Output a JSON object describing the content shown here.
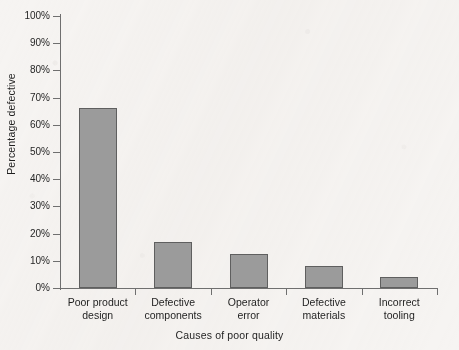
{
  "chart_data": {
    "type": "bar",
    "title": "",
    "xlabel": "Causes of poor quality",
    "ylabel": "Percentage defective",
    "categories": [
      "Poor product design",
      "Defective components",
      "Operator error",
      "Defective materials",
      "Incorrect tooling"
    ],
    "category_lines": [
      [
        "Poor product",
        "design"
      ],
      [
        "Defective",
        "components"
      ],
      [
        "Operator",
        "error"
      ],
      [
        "Defective",
        "materials"
      ],
      [
        "Incorrect",
        "tooling"
      ]
    ],
    "values": [
      66,
      17,
      12.5,
      8,
      4
    ],
    "ylim": [
      0,
      100
    ],
    "ytick_values": [
      0,
      10,
      20,
      30,
      40,
      50,
      60,
      70,
      80,
      90,
      100
    ],
    "ytick_labels": [
      "0%",
      "10%",
      "20%",
      "30%",
      "40%",
      "50%",
      "60%",
      "70%",
      "80%",
      "90%",
      "100%"
    ],
    "grid": false,
    "legend": null,
    "bar_fill_color": "#9b9b9b",
    "bar_border_color": "#5f5f5f",
    "axis_color": "#6f6f6f",
    "background_color": "#f6f4f2"
  }
}
